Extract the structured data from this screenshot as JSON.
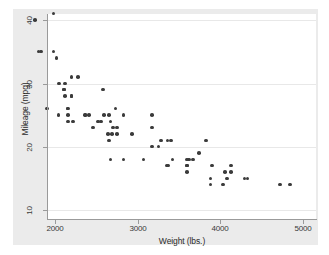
{
  "chart_data": {
    "type": "scatter",
    "title": "",
    "xlabel": "Weight (lbs.)",
    "ylabel": "Mileage (mpg)",
    "xlim": [
      1760,
      5080
    ],
    "ylim": [
      9.2,
      41.2
    ],
    "xticks": [
      2000,
      3000,
      4000,
      5000
    ],
    "xtick_labels": [
      "2000",
      "3000",
      "4000",
      "5000"
    ],
    "yticks": [
      10,
      20,
      30,
      40
    ],
    "ytick_labels": [
      "10",
      "20",
      "30",
      "40"
    ],
    "grid": "horizontal",
    "legend": "none",
    "marker": {
      "shape": "circle",
      "color": "#3b3b3b",
      "size": 3.6
    },
    "points": [
      {
        "x": 2930,
        "y": 22
      },
      {
        "x": 3350,
        "y": 17
      },
      {
        "x": 2640,
        "y": 22
      },
      {
        "x": 3250,
        "y": 20
      },
      {
        "x": 4080,
        "y": 15
      },
      {
        "x": 3670,
        "y": 18
      },
      {
        "x": 3880,
        "y": 14
      },
      {
        "x": 3400,
        "y": 21
      },
      {
        "x": 2110,
        "y": 29
      },
      {
        "x": 3600,
        "y": 16
      },
      {
        "x": 3600,
        "y": 17
      },
      {
        "x": 3740,
        "y": 19
      },
      {
        "x": 4840,
        "y": 14
      },
      {
        "x": 4720,
        "y": 14
      },
      {
        "x": 3830,
        "y": 21
      },
      {
        "x": 2580,
        "y": 29
      },
      {
        "x": 4060,
        "y": 16
      },
      {
        "x": 4130,
        "y": 16
      },
      {
        "x": 4130,
        "y": 17
      },
      {
        "x": 2690,
        "y": 22
      },
      {
        "x": 3370,
        "y": 17
      },
      {
        "x": 3070,
        "y": 18
      },
      {
        "x": 3620,
        "y": 18
      },
      {
        "x": 3600,
        "y": 17
      },
      {
        "x": 3600,
        "y": 18
      },
      {
        "x": 4330,
        "y": 15
      },
      {
        "x": 3900,
        "y": 17
      },
      {
        "x": 4290,
        "y": 15
      },
      {
        "x": 2110,
        "y": 29
      },
      {
        "x": 2200,
        "y": 28
      },
      {
        "x": 2150,
        "y": 26
      },
      {
        "x": 2670,
        "y": 24
      },
      {
        "x": 2595,
        "y": 25
      },
      {
        "x": 2700,
        "y": 23
      },
      {
        "x": 2556,
        "y": 24
      },
      {
        "x": 2200,
        "y": 28
      },
      {
        "x": 3280,
        "y": 21
      },
      {
        "x": 3880,
        "y": 15
      },
      {
        "x": 4030,
        "y": 14
      },
      {
        "x": 3360,
        "y": 21
      },
      {
        "x": 1800,
        "y": 35
      },
      {
        "x": 1760,
        "y": 40
      },
      {
        "x": 2050,
        "y": 30
      },
      {
        "x": 1830,
        "y": 35
      },
      {
        "x": 2410,
        "y": 25
      },
      {
        "x": 2040,
        "y": 25
      },
      {
        "x": 1900,
        "y": 26
      },
      {
        "x": 2220,
        "y": 24
      },
      {
        "x": 2520,
        "y": 24
      },
      {
        "x": 2650,
        "y": 21
      },
      {
        "x": 2750,
        "y": 22
      },
      {
        "x": 3170,
        "y": 23
      },
      {
        "x": 2730,
        "y": 26
      },
      {
        "x": 2360,
        "y": 25
      },
      {
        "x": 2460,
        "y": 23
      },
      {
        "x": 2830,
        "y": 25
      },
      {
        "x": 2200,
        "y": 31
      },
      {
        "x": 2020,
        "y": 34
      },
      {
        "x": 2280,
        "y": 31
      },
      {
        "x": 2750,
        "y": 23
      },
      {
        "x": 3170,
        "y": 20
      },
      {
        "x": 2120,
        "y": 30
      },
      {
        "x": 1980,
        "y": 35
      },
      {
        "x": 2670,
        "y": 18
      },
      {
        "x": 2160,
        "y": 25
      },
      {
        "x": 2370,
        "y": 25
      },
      {
        "x": 2120,
        "y": 28
      },
      {
        "x": 2160,
        "y": 24
      },
      {
        "x": 2650,
        "y": 25
      },
      {
        "x": 1980,
        "y": 41
      },
      {
        "x": 3170,
        "y": 25
      },
      {
        "x": 2160,
        "y": 26
      },
      {
        "x": 3420,
        "y": 18
      },
      {
        "x": 2830,
        "y": 18
      }
    ],
    "plotted_markers": [
      {
        "px": 55,
        "py": 20
      },
      {
        "px": 55,
        "py": 74
      },
      {
        "px": 55,
        "py": 146
      },
      {
        "px": 56,
        "py": 54
      },
      {
        "px": 57,
        "py": 58
      },
      {
        "px": 57,
        "py": 72
      },
      {
        "px": 58,
        "py": 73
      },
      {
        "px": 56,
        "py": 102
      },
      {
        "px": 59,
        "py": 99
      },
      {
        "px": 60,
        "py": 104
      },
      {
        "px": 62,
        "py": 100
      },
      {
        "px": 61,
        "py": 106
      },
      {
        "px": 63,
        "py": 105
      },
      {
        "px": 64,
        "py": 101
      },
      {
        "px": 60,
        "py": 76
      },
      {
        "px": 58,
        "py": 76
      },
      {
        "px": 62,
        "py": 108
      },
      {
        "px": 65,
        "py": 103
      },
      {
        "px": 86,
        "py": 107
      },
      {
        "px": 88,
        "py": 103
      },
      {
        "px": 89,
        "py": 110
      },
      {
        "px": 92,
        "py": 100
      },
      {
        "px": 93,
        "py": 104
      },
      {
        "px": 90,
        "py": 106
      },
      {
        "px": 84,
        "py": 141
      },
      {
        "px": 85,
        "py": 146
      },
      {
        "px": 87,
        "py": 144
      },
      {
        "px": 97,
        "py": 108
      },
      {
        "px": 98,
        "py": 142
      },
      {
        "px": 124,
        "py": 139
      },
      {
        "px": 129,
        "py": 144
      },
      {
        "px": 132,
        "py": 141
      },
      {
        "px": 134,
        "py": 149
      },
      {
        "px": 140,
        "py": 142
      },
      {
        "px": 142,
        "py": 139
      },
      {
        "px": 126,
        "py": 102
      },
      {
        "px": 128,
        "py": 172
      },
      {
        "px": 128,
        "py": 179
      },
      {
        "px": 162,
        "py": 140
      },
      {
        "px": 165,
        "py": 143
      },
      {
        "px": 166,
        "py": 138
      },
      {
        "px": 168,
        "py": 147
      },
      {
        "px": 170,
        "py": 142
      },
      {
        "px": 172,
        "py": 136
      },
      {
        "px": 174,
        "py": 140
      },
      {
        "px": 176,
        "py": 138
      },
      {
        "px": 166,
        "py": 150
      },
      {
        "px": 169,
        "py": 152
      },
      {
        "px": 161,
        "py": 170
      },
      {
        "px": 164,
        "py": 168
      },
      {
        "px": 166,
        "py": 176
      },
      {
        "px": 172,
        "py": 170
      },
      {
        "px": 176,
        "py": 168
      },
      {
        "px": 179,
        "py": 175
      },
      {
        "px": 178,
        "py": 80
      },
      {
        "px": 212,
        "py": 156
      },
      {
        "px": 208,
        "py": 172
      },
      {
        "px": 212,
        "py": 176
      },
      {
        "px": 214,
        "py": 168
      },
      {
        "px": 216,
        "py": 170
      },
      {
        "px": 217,
        "py": 164
      },
      {
        "px": 218,
        "py": 180
      },
      {
        "px": 220,
        "py": 171
      },
      {
        "px": 252,
        "py": 175
      },
      {
        "px": 268,
        "py": 143
      },
      {
        "px": 268,
        "py": 207
      },
      {
        "px": 303,
        "py": 208
      }
    ]
  }
}
